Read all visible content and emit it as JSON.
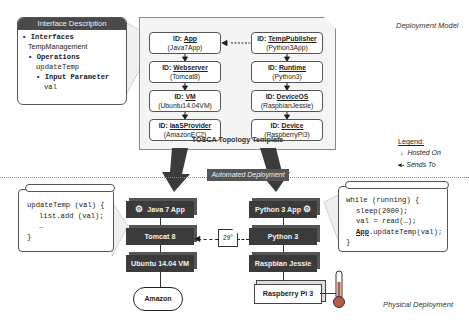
{
  "labels": {
    "deployment_model": "Deployment Model",
    "physical_deployment": "Physical Deployment",
    "automated_deployment": "Automated Deployment",
    "tosca_caption": "TOSCA Topology Template"
  },
  "interface": {
    "title": "Interface Description",
    "interfaces_label": "Interfaces",
    "interface_name": "TempManagement",
    "operations_label": "Operations",
    "operation_name": "updateTemp",
    "input_param_label": "Input Parameter",
    "param_name": "val"
  },
  "tosca": {
    "left": [
      {
        "id_prefix": "ID: ",
        "id": "App",
        "type": "(Java7App)"
      },
      {
        "id_prefix": "ID: ",
        "id": "Webserver",
        "type": "(Tomcat8)"
      },
      {
        "id_prefix": "ID: ",
        "id": "VM",
        "type": "(Ubuntu14.04VM)"
      },
      {
        "id_prefix": "ID: ",
        "id": "IaaSProvider",
        "type": "(AmazonEC2)"
      }
    ],
    "right": [
      {
        "id_prefix": "ID: ",
        "id": "TempPublisher",
        "type": "(Python3App)"
      },
      {
        "id_prefix": "ID: ",
        "id": "Runtime",
        "type": "(Python3)"
      },
      {
        "id_prefix": "ID: ",
        "id": "DeviceOS",
        "type": "(RaspbianJessie)"
      },
      {
        "id_prefix": "ID: ",
        "id": "Device",
        "type": "(RaspberryPi3)"
      }
    ]
  },
  "legend": {
    "title": "Legend:",
    "hosted_on": "Hosted On",
    "sends_to": "Sends To"
  },
  "physical": {
    "left_stack": [
      "Java 7 App",
      "Tomcat 8",
      "Ubuntu 14.04 VM"
    ],
    "cloud": "Amazon",
    "right_stack": [
      "Python 3 App",
      "Python 3",
      "Raspbian Jessie"
    ],
    "device": "Raspberry Pi 3",
    "message": "29°"
  },
  "code_left": {
    "line1": "updateTemp (val) {",
    "line2": "list.add (val);",
    "line3": "…",
    "line4": "}"
  },
  "code_right": {
    "line1": "while (running) {",
    "line2": "sleep(2000);",
    "line3": "val = read(…);",
    "line4_app": "App",
    "line4_rest": ".updateTemp(val);",
    "line5": "}"
  }
}
